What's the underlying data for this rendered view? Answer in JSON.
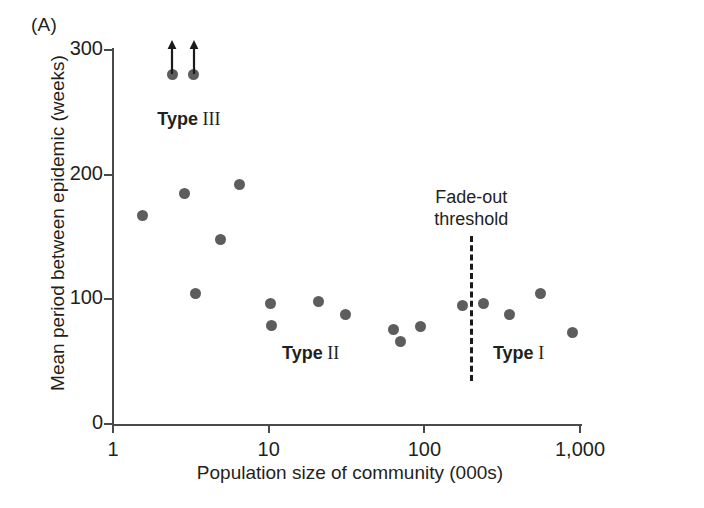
{
  "panel": {
    "label": "(A)"
  },
  "chart_data": {
    "type": "scatter",
    "title": "",
    "xlabel": "Population size of community (000s)",
    "ylabel": "Mean period between epidemic (weeks)",
    "xscale": "log",
    "xlim": [
      1,
      1000
    ],
    "ylim": [
      0,
      300
    ],
    "grid": false,
    "legend_position": "none",
    "xticks": [
      {
        "value": 1,
        "label": "1"
      },
      {
        "value": 10,
        "label": "10"
      },
      {
        "value": 100,
        "label": "100"
      },
      {
        "value": 1000,
        "label": "1,000"
      }
    ],
    "yticks": [
      {
        "value": 0,
        "label": "0"
      },
      {
        "value": 100,
        "label": "100"
      },
      {
        "value": 200,
        "label": "200"
      },
      {
        "value": 300,
        "label": "300"
      }
    ],
    "points": [
      {
        "x": 2.4,
        "y": 280,
        "censored": true,
        "note": "exceeds axis maximum"
      },
      {
        "x": 3.3,
        "y": 280,
        "censored": true,
        "note": "exceeds axis maximum"
      },
      {
        "x": 1.55,
        "y": 167,
        "censored": false,
        "note": ""
      },
      {
        "x": 2.9,
        "y": 185,
        "censored": false,
        "note": ""
      },
      {
        "x": 4.9,
        "y": 148,
        "censored": false,
        "note": ""
      },
      {
        "x": 6.5,
        "y": 192,
        "censored": false,
        "note": ""
      },
      {
        "x": 3.4,
        "y": 105,
        "censored": false,
        "note": ""
      },
      {
        "x": 10.2,
        "y": 97,
        "censored": false,
        "note": ""
      },
      {
        "x": 10.4,
        "y": 79,
        "censored": false,
        "note": ""
      },
      {
        "x": 21,
        "y": 98,
        "censored": false,
        "note": ""
      },
      {
        "x": 31,
        "y": 88,
        "censored": false,
        "note": ""
      },
      {
        "x": 63,
        "y": 76,
        "censored": false,
        "note": ""
      },
      {
        "x": 70,
        "y": 66,
        "censored": false,
        "note": ""
      },
      {
        "x": 95,
        "y": 78,
        "censored": false,
        "note": ""
      },
      {
        "x": 175,
        "y": 95,
        "censored": false,
        "note": ""
      },
      {
        "x": 240,
        "y": 97,
        "censored": false,
        "note": ""
      },
      {
        "x": 350,
        "y": 88,
        "censored": false,
        "note": ""
      },
      {
        "x": 560,
        "y": 105,
        "censored": false,
        "note": ""
      },
      {
        "x": 900,
        "y": 73,
        "censored": false,
        "note": ""
      }
    ],
    "annotations": [
      {
        "id": "type-iii",
        "bold_text": "Type",
        "roman_text": "III",
        "x": 3.0,
        "y": 243
      },
      {
        "id": "type-ii",
        "bold_text": "Type",
        "roman_text": "II",
        "x": 19,
        "y": 55
      },
      {
        "id": "type-i",
        "bold_text": "Type",
        "roman_text": "I",
        "x": 430,
        "y": 55
      }
    ],
    "threshold": {
      "label_line1": "Fade-out",
      "label_line2": "threshold",
      "x": 200,
      "style": "dashed"
    },
    "colors": {
      "marker": "#5d5d5d",
      "axis": "#4a4a4a",
      "text": "#231f20",
      "threshold": "#1a1a1a",
      "background": "#ffffff"
    }
  }
}
